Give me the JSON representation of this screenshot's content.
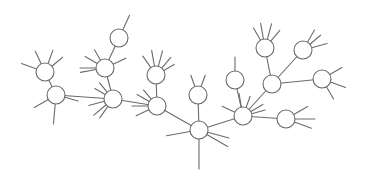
{
  "diagram": {
    "type": "tree-network",
    "colors": {
      "line": "#6b6b6b",
      "node_fill": "#ffffff",
      "background": "#ffffff"
    },
    "nodes": [
      {
        "id": "A",
        "leaves": 4
      },
      {
        "id": "B",
        "leaves": 3
      },
      {
        "id": "C",
        "leaves": 5
      },
      {
        "id": "D",
        "leaves": 1
      },
      {
        "id": "E",
        "leaves": 5
      },
      {
        "id": "F",
        "leaves": 5
      },
      {
        "id": "G",
        "leaves": 4
      },
      {
        "id": "H",
        "leaves": 2
      },
      {
        "id": "I",
        "leaves": 4
      },
      {
        "id": "J",
        "leaves": 1
      },
      {
        "id": "K",
        "leaves": 5
      },
      {
        "id": "L",
        "leaves": 4
      },
      {
        "id": "M",
        "leaves": 0
      },
      {
        "id": "N",
        "leaves": 3
      },
      {
        "id": "O",
        "leaves": 3
      },
      {
        "id": "P",
        "leaves": 3
      }
    ],
    "edges": [
      [
        "A",
        "B"
      ],
      [
        "B",
        "E"
      ],
      [
        "C",
        "D"
      ],
      [
        "C",
        "E"
      ],
      [
        "E",
        "G"
      ],
      [
        "F",
        "G"
      ],
      [
        "G",
        "I"
      ],
      [
        "H",
        "I"
      ],
      [
        "I",
        "K"
      ],
      [
        "J",
        "K"
      ],
      [
        "K",
        "M"
      ],
      [
        "L",
        "M"
      ],
      [
        "M",
        "N"
      ],
      [
        "M",
        "O"
      ],
      [
        "K",
        "P"
      ]
    ]
  }
}
